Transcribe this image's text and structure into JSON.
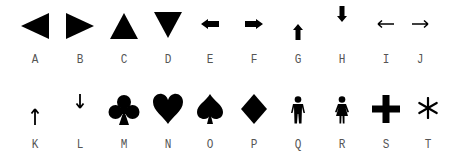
{
  "symbols": [
    {
      "label": "A",
      "icon": "triangle-left-icon"
    },
    {
      "label": "B",
      "icon": "triangle-right-icon"
    },
    {
      "label": "C",
      "icon": "triangle-up-icon"
    },
    {
      "label": "D",
      "icon": "triangle-down-icon"
    },
    {
      "label": "E",
      "icon": "bold-arrow-left-icon"
    },
    {
      "label": "F",
      "icon": "bold-arrow-right-icon"
    },
    {
      "label": "G",
      "icon": "bold-arrow-up-icon"
    },
    {
      "label": "H",
      "icon": "bold-arrow-down-icon"
    },
    {
      "label": "I",
      "icon": "thin-arrow-left-icon"
    },
    {
      "label": "J",
      "icon": "thin-arrow-right-icon"
    },
    {
      "label": "K",
      "icon": "thin-arrow-up-icon"
    },
    {
      "label": "L",
      "icon": "thin-arrow-down-icon"
    },
    {
      "label": "M",
      "icon": "club-icon"
    },
    {
      "label": "N",
      "icon": "heart-icon"
    },
    {
      "label": "O",
      "icon": "spade-icon"
    },
    {
      "label": "P",
      "icon": "diamond-icon"
    },
    {
      "label": "Q",
      "icon": "man-icon"
    },
    {
      "label": "R",
      "icon": "woman-icon"
    },
    {
      "label": "S",
      "icon": "plus-icon"
    },
    {
      "label": "T",
      "icon": "asterisk-icon"
    }
  ],
  "colors": {
    "symbol": "#000000",
    "label": "#555555",
    "background": "#ffffff"
  }
}
